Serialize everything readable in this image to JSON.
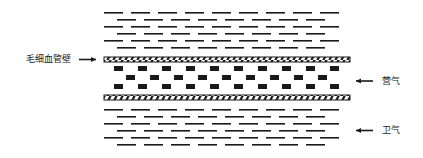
{
  "diagram": {
    "title": "",
    "labels": {
      "wall": "毛细血管壁",
      "ying_qi": "营气",
      "wei_qi": "卫气"
    },
    "colors": {
      "ink": "#1a1a1a",
      "background": "#ffffff"
    },
    "layout": {
      "x_start": 104,
      "x_end": 350,
      "top_dash_rows_y": [
        12,
        19,
        26,
        33,
        40,
        47
      ],
      "top_wall_y": 57,
      "particle_rows_y": [
        66,
        75,
        84
      ],
      "bottom_wall_y": 95,
      "bottom_dash_rows_y": [
        109,
        116,
        123,
        130,
        137,
        144
      ]
    },
    "legend": [
      {
        "text": "毛细血管壁",
        "points_to": "capillary wall (hatched band)",
        "arrow": "right"
      },
      {
        "text": "营气",
        "points_to": "nutrient qi (black particles inside vessel)",
        "arrow": "left"
      },
      {
        "text": "卫气",
        "points_to": "defensive qi (dashes outside vessel)",
        "arrow": "left"
      }
    ]
  }
}
